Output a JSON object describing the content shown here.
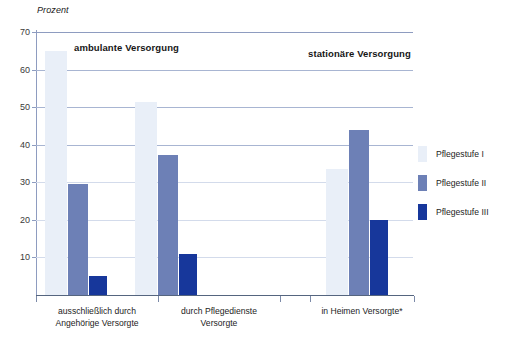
{
  "chart_data": {
    "type": "bar",
    "title": "",
    "subtitle": "",
    "xlabel": "",
    "ylabel": "Prozent",
    "ylim": [
      0,
      70
    ],
    "yticks": [
      70,
      60,
      50,
      40,
      30,
      20,
      10
    ],
    "grid": true,
    "legend_position": "right",
    "categories": [
      "ausschließlich durch\nAngehörige Versorgte",
      "durch Pflegedienste\nVersorgte",
      "in Heimen Versorgte*"
    ],
    "category_lines": [
      [
        "ausschließlich durch",
        "Angehörige Versorgte"
      ],
      [
        "durch Pflegedienste",
        "Versorgte"
      ],
      [
        "in Heimen Versorgte*"
      ]
    ],
    "series": [
      {
        "name": "Pflegestufe I",
        "color": "#e9eff8",
        "values": [
          65,
          51.5,
          33.5
        ]
      },
      {
        "name": "Pflegestufe II",
        "color": "#6d80b6",
        "values": [
          29.5,
          37.3,
          44
        ]
      },
      {
        "name": "Pflegestufe III",
        "color": "#17379b",
        "values": [
          5,
          11,
          20
        ]
      }
    ],
    "annotations": [
      {
        "text": "ambulante Versorgung",
        "covers": [
          "ausschließlich durch Angehörige Versorgte",
          "durch Pflegedienste Versorgte"
        ]
      },
      {
        "text": "stationäre Versorgung",
        "covers": [
          "in Heimen Versorgte*"
        ]
      }
    ]
  },
  "axis": {
    "unit_label": "Prozent",
    "ytick_labels": [
      "70",
      "60",
      "50",
      "40",
      "30",
      "20",
      "10"
    ]
  },
  "groups": {
    "ambulant": "ambulante Versorgung",
    "stationaer": "stationäre Versorgung"
  },
  "legend": {
    "items": [
      {
        "label": "Pflegestufe I"
      },
      {
        "label": "Pflegestufe II"
      },
      {
        "label": "Pflegestufe III"
      }
    ]
  }
}
